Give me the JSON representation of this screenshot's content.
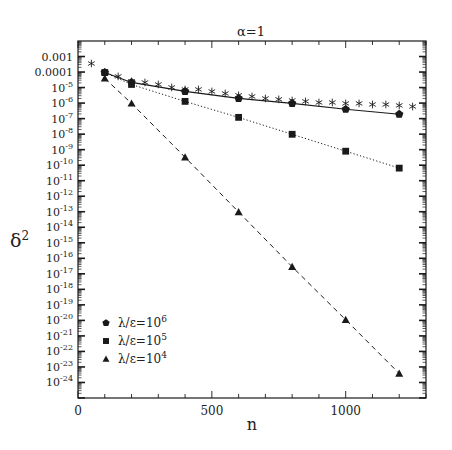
{
  "chart_data": {
    "type": "line",
    "title": "α=1",
    "xlabel": "n",
    "ylabel": "δ²",
    "xlim": [
      0,
      1300
    ],
    "ylim_log10": [
      -25,
      -2
    ],
    "yscale": "log",
    "grid": false,
    "legend_position": "lower left",
    "x_ticks": [
      0,
      500,
      1000
    ],
    "x_tick_labels": [
      "0",
      "500",
      "1000"
    ],
    "x_minor_step": 100,
    "y_tick_labels": [
      {
        "exp": -3,
        "label": "0.001"
      },
      {
        "exp": -4,
        "label": "0.0001"
      },
      {
        "exp": -5,
        "label": "10",
        "sup": "-5"
      },
      {
        "exp": -6,
        "label": "10",
        "sup": "-6"
      },
      {
        "exp": -7,
        "label": "10",
        "sup": "-7"
      },
      {
        "exp": -8,
        "label": "10",
        "sup": "-8"
      },
      {
        "exp": -9,
        "label": "10",
        "sup": "-9"
      },
      {
        "exp": -10,
        "label": "10",
        "sup": "-10"
      },
      {
        "exp": -11,
        "label": "10",
        "sup": "-11"
      },
      {
        "exp": -12,
        "label": "10",
        "sup": "-12"
      },
      {
        "exp": -13,
        "label": "10",
        "sup": "-13"
      },
      {
        "exp": -14,
        "label": "10",
        "sup": "-14"
      },
      {
        "exp": -15,
        "label": "10",
        "sup": "-15"
      },
      {
        "exp": -16,
        "label": "10",
        "sup": "-16"
      },
      {
        "exp": -17,
        "label": "10",
        "sup": "-17"
      },
      {
        "exp": -18,
        "label": "10",
        "sup": "-18"
      },
      {
        "exp": -19,
        "label": "10",
        "sup": "-19"
      },
      {
        "exp": -20,
        "label": "10",
        "sup": "-20"
      },
      {
        "exp": -21,
        "label": "10",
        "sup": "-21"
      },
      {
        "exp": -22,
        "label": "10",
        "sup": "-22"
      },
      {
        "exp": -23,
        "label": "10",
        "sup": "-23"
      },
      {
        "exp": -24,
        "label": "10",
        "sup": "-24"
      }
    ],
    "series": [
      {
        "name": "λ/ε=10⁶",
        "legend_base": "λ/ε=10",
        "legend_sup": "6",
        "marker": "pentagon",
        "line": "solid",
        "x": [
          100,
          200,
          400,
          600,
          800,
          1000,
          1200
        ],
        "log10_y": [
          -4.03,
          -4.67,
          -5.25,
          -5.7,
          -6.02,
          -6.4,
          -6.72
        ]
      },
      {
        "name": "λ/ε=10⁵",
        "legend_base": "λ/ε=10",
        "legend_sup": "5",
        "marker": "square",
        "line": "dotted",
        "x": [
          100,
          200,
          400,
          600,
          800,
          1000,
          1200
        ],
        "log10_y": [
          -4.03,
          -4.8,
          -5.89,
          -6.92,
          -8.01,
          -9.1,
          -10.19
        ]
      },
      {
        "name": "λ/ε=10⁴",
        "legend_base": "λ/ε=10",
        "legend_sup": "4",
        "marker": "triangle",
        "line": "dashed",
        "x": [
          100,
          200,
          400,
          600,
          800,
          1000,
          1200
        ],
        "log10_y": [
          -4.41,
          -6.02,
          -9.49,
          -13.02,
          -16.55,
          -19.96,
          -23.42
        ]
      },
      {
        "name": "unlabeled reference (asterisks)",
        "marker": "asterisk",
        "line": "none",
        "x": [
          50,
          100,
          150,
          200,
          250,
          300,
          350,
          400,
          450,
          500,
          550,
          600,
          650,
          700,
          750,
          800,
          850,
          900,
          950,
          1000,
          1050,
          1100,
          1150,
          1200,
          1250
        ],
        "log10_y": [
          -3.45,
          -4.03,
          -4.28,
          -4.6,
          -4.67,
          -4.8,
          -4.99,
          -5.12,
          -5.12,
          -5.25,
          -5.38,
          -5.5,
          -5.57,
          -5.7,
          -5.76,
          -5.83,
          -5.89,
          -5.96,
          -5.96,
          -6.02,
          -6.02,
          -6.09,
          -6.09,
          -6.15,
          -6.22
        ]
      }
    ]
  },
  "colors": {
    "ink": "#1a1a1a",
    "background": "#ffffff"
  }
}
